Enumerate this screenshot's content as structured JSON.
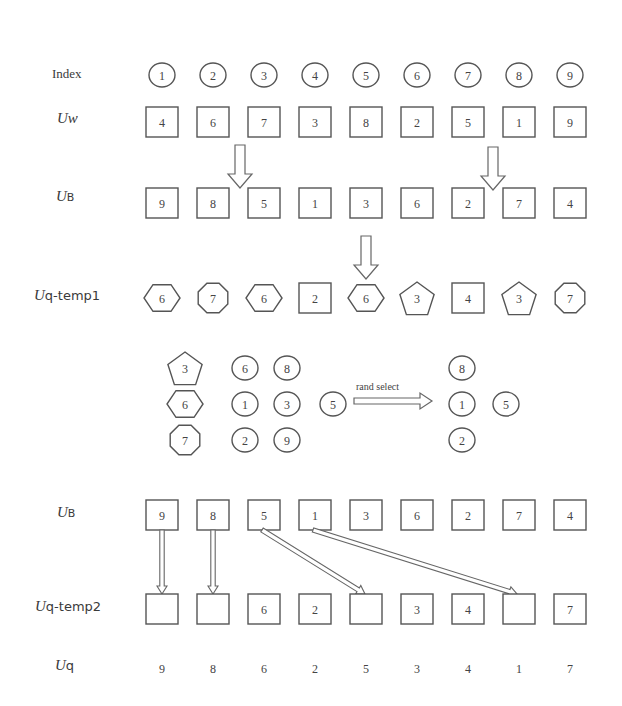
{
  "labels": {
    "index": "Index",
    "uw_main": "U",
    "uw_sub": "w",
    "ub_main": "U",
    "ub_sub": "B",
    "uqtemp1_main": "U",
    "uqtemp1_sub": "q-temp1",
    "ub2_main": "U",
    "ub2_sub": "B",
    "uqtemp2_main": "U",
    "uqtemp2_sub": "q-temp2",
    "uq_main": "U",
    "uq_sub": "q",
    "rand_select": "rand_select"
  },
  "rows": {
    "index": [
      "1",
      "2",
      "3",
      "4",
      "5",
      "6",
      "7",
      "8",
      "9"
    ],
    "uw": [
      "4",
      "6",
      "7",
      "3",
      "8",
      "2",
      "5",
      "1",
      "9"
    ],
    "ub": [
      "9",
      "8",
      "5",
      "1",
      "3",
      "6",
      "2",
      "7",
      "4"
    ],
    "uq_temp1": [
      {
        "value": "6",
        "shape": "hexagon"
      },
      {
        "value": "7",
        "shape": "octagon"
      },
      {
        "value": "6",
        "shape": "hexagon"
      },
      {
        "value": "2",
        "shape": "square"
      },
      {
        "value": "6",
        "shape": "hexagon"
      },
      {
        "value": "3",
        "shape": "pentagon"
      },
      {
        "value": "4",
        "shape": "square"
      },
      {
        "value": "3",
        "shape": "pentagon"
      },
      {
        "value": "7",
        "shape": "octagon"
      }
    ],
    "ub_repeat": [
      "9",
      "8",
      "5",
      "1",
      "3",
      "6",
      "2",
      "7",
      "4"
    ],
    "uq_temp2": [
      "",
      "",
      "6",
      "2",
      "",
      "3",
      "4",
      "",
      "7"
    ],
    "uq": [
      "9",
      "8",
      "6",
      "2",
      "5",
      "3",
      "4",
      "1",
      "7"
    ]
  },
  "cluster": {
    "duplicates": [
      {
        "value": "3",
        "shape": "pentagon"
      },
      {
        "value": "6",
        "shape": "hexagon"
      },
      {
        "value": "7",
        "shape": "octagon"
      }
    ],
    "candidates_grid": [
      [
        "6",
        "8"
      ],
      [
        "1",
        "3"
      ],
      [
        "2",
        "9"
      ]
    ],
    "candidate_extra": "5",
    "selected_column": [
      "8",
      "1",
      "2"
    ],
    "selected_extra": "5"
  }
}
